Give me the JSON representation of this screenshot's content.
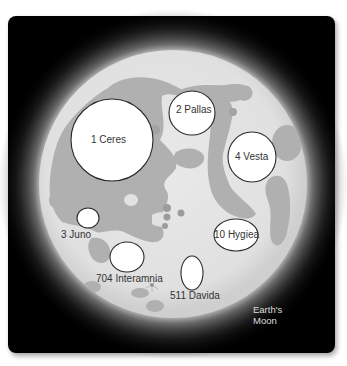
{
  "figure": {
    "moon_label_line1": "Earth's",
    "moon_label_line2": "Moon",
    "colors": {
      "background": "#000000",
      "moon_highland": "#e2e2e2",
      "moon_maria": "#b0b0b0",
      "asteroid_fill": "#ffffff",
      "asteroid_outline": "#2a2a2a",
      "label_text": "#333333",
      "moon_label_text": "#dcdcdc"
    }
  },
  "asteroids": [
    {
      "name": "1 Ceres",
      "cx": 112,
      "cy": 140,
      "rx": 41,
      "ry": 41
    },
    {
      "name": "2 Pallas",
      "cx": 192,
      "cy": 113,
      "rx": 23,
      "ry": 22
    },
    {
      "name": "3 Juno",
      "cx": 88,
      "cy": 218,
      "rx": 11,
      "ry": 10
    },
    {
      "name": "4 Vesta",
      "cx": 252,
      "cy": 157,
      "rx": 24,
      "ry": 25
    },
    {
      "name": "10 Hygiea",
      "cx": 236,
      "cy": 235,
      "rx": 22,
      "ry": 16
    },
    {
      "name": "704 Interamnia",
      "cx": 127,
      "cy": 257,
      "rx": 17,
      "ry": 15
    },
    {
      "name": "511 Davida",
      "cx": 192,
      "cy": 273,
      "rx": 11,
      "ry": 17
    }
  ]
}
